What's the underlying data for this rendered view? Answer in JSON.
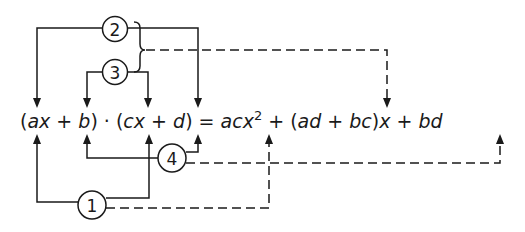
{
  "diagram": {
    "equation": {
      "lhs": {
        "open1": "(",
        "a": "a",
        "x1": "x",
        "plus1": " + ",
        "b": "b",
        "close1": ")",
        "dot": " · ",
        "open2": "(",
        "c": "c",
        "x2": "x",
        "plus2": " + ",
        "d": "d",
        "close2": ")"
      },
      "equals": " = ",
      "rhs": {
        "acx": "acx",
        "exp": "2",
        "plus3": " + ",
        "open3": "(",
        "ad": "ad",
        "plus4": " + ",
        "bc": "bc",
        "close3": ")",
        "x3": "x",
        "plus5": " + ",
        "bd": "bd"
      }
    },
    "markers": [
      {
        "label": "1",
        "meaning": "first terms a·c",
        "target": "acx²"
      },
      {
        "label": "2",
        "meaning": "outer terms a·d",
        "target": "ad + bc"
      },
      {
        "label": "3",
        "meaning": "inner terms b·c",
        "target": "ad + bc"
      },
      {
        "label": "4",
        "meaning": "last terms b·d",
        "target": "bd"
      }
    ]
  }
}
